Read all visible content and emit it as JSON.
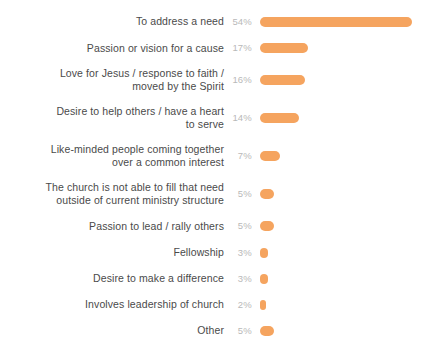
{
  "chart_data": {
    "type": "bar",
    "orientation": "horizontal",
    "title": "",
    "xlabel": "",
    "ylabel": "",
    "grid": false,
    "legend": null,
    "value_suffix": "%",
    "bar_color": "#f5a45f",
    "label_color": "#4a4a4a",
    "value_color": "#b9b9b9",
    "background": "#ffffff",
    "xlim": [
      0,
      54
    ],
    "categories": [
      "To address a need",
      "Passion or vision for a cause",
      "Love for Jesus / response to faith /\nmoved by the Spirit",
      "Desire to help others / have a heart\nto serve",
      "Like-minded people coming together\nover a common interest",
      "The church is not able to fill that need\noutside of current ministry structure",
      "Passion to lead / rally others",
      "Fellowship",
      "Desire to make a difference",
      "Involves leadership of church",
      "Other"
    ],
    "values": [
      54,
      17,
      16,
      14,
      7,
      5,
      5,
      3,
      3,
      2,
      5
    ],
    "value_labels": [
      "54%",
      "17%",
      "16%",
      "14%",
      "7%",
      "5%",
      "5%",
      "3%",
      "3%",
      "2%",
      "5%"
    ],
    "rows": [
      {
        "label": "To address a need",
        "value": 54,
        "value_label": "54%",
        "lines": 1
      },
      {
        "label": "Passion or vision for a cause",
        "value": 17,
        "value_label": "17%",
        "lines": 1
      },
      {
        "label": "Love for Jesus / response to faith /\nmoved by the Spirit",
        "value": 16,
        "value_label": "16%",
        "lines": 2
      },
      {
        "label": "Desire to help others / have a heart\nto serve",
        "value": 14,
        "value_label": "14%",
        "lines": 2
      },
      {
        "label": "Like-minded people coming together\nover a common interest",
        "value": 7,
        "value_label": "7%",
        "lines": 2
      },
      {
        "label": "The church is not able to fill that need\noutside of current ministry structure",
        "value": 5,
        "value_label": "5%",
        "lines": 2
      },
      {
        "label": "Passion to lead / rally others",
        "value": 5,
        "value_label": "5%",
        "lines": 1
      },
      {
        "label": "Fellowship",
        "value": 3,
        "value_label": "3%",
        "lines": 1
      },
      {
        "label": "Desire to make a difference",
        "value": 3,
        "value_label": "3%",
        "lines": 1
      },
      {
        "label": "Involves leadership of church",
        "value": 2,
        "value_label": "2%",
        "lines": 1
      },
      {
        "label": "Other",
        "value": 5,
        "value_label": "5%",
        "lines": 1
      }
    ]
  }
}
